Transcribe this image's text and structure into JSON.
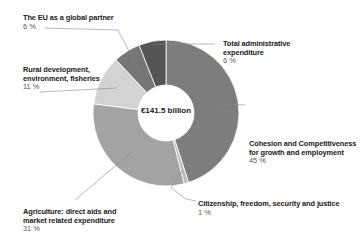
{
  "chart_data": {
    "type": "pie",
    "variant": "donut",
    "title": "",
    "center_label": "€141.5 billion",
    "total": "€141.5 billion",
    "slices": [
      {
        "name": "Cohesion and Competitiveness for growth and employment",
        "line1": "Cohesion and Competitiveness",
        "line2": "for growth and employment",
        "value": 45,
        "pct_label": "45 %",
        "color": "#7d7d7d"
      },
      {
        "name": "Citizenship, freedom, security and justice",
        "line1": "Citizenship, freedom, security and justice",
        "line2": "",
        "value": 1,
        "pct_label": "1 %",
        "color": "#bdbdbd"
      },
      {
        "name": "Agriculture: direct aids and market related expenditure",
        "line1": "Agriculture: direct aids and",
        "line2": "market related expenditure",
        "value": 31,
        "pct_label": "31 %",
        "color": "#a3a3a3"
      },
      {
        "name": "Rural development, environment, fisheries",
        "line1": "Rural development,",
        "line2": "environment, fisheries",
        "value": 11,
        "pct_label": "11 %",
        "color": "#d3d3d3"
      },
      {
        "name": "The EU as a global partner",
        "line1": "The EU as a global partner",
        "line2": "",
        "value": 6,
        "pct_label": "6 %",
        "color": "#767676"
      },
      {
        "name": "Total administrative expenditure",
        "line1": "Total administrative",
        "line2": "expenditure",
        "value": 6,
        "pct_label": "6 %",
        "color": "#555555"
      }
    ],
    "legend": "none (direct labels)"
  }
}
